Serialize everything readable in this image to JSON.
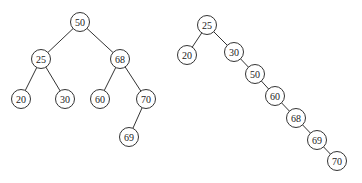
{
  "diagram": {
    "type": "binary-search-trees",
    "node_radius": 9.5,
    "trees": [
      {
        "name": "balanced-bst",
        "nodes": [
          {
            "id": "l50",
            "label": "50",
            "x": 80,
            "y": 22
          },
          {
            "id": "l25",
            "label": "25",
            "x": 41,
            "y": 59
          },
          {
            "id": "l68",
            "label": "68",
            "x": 120,
            "y": 59
          },
          {
            "id": "l20",
            "label": "20",
            "x": 21,
            "y": 99
          },
          {
            "id": "l30",
            "label": "30",
            "x": 65,
            "y": 99
          },
          {
            "id": "l60",
            "label": "60",
            "x": 100,
            "y": 99
          },
          {
            "id": "l70",
            "label": "70",
            "x": 146,
            "y": 99
          },
          {
            "id": "l69",
            "label": "69",
            "x": 129,
            "y": 137
          }
        ],
        "edges": [
          [
            "l50",
            "l25"
          ],
          [
            "l50",
            "l68"
          ],
          [
            "l25",
            "l20"
          ],
          [
            "l25",
            "l30"
          ],
          [
            "l68",
            "l60"
          ],
          [
            "l68",
            "l70"
          ],
          [
            "l70",
            "l69"
          ]
        ]
      },
      {
        "name": "skewed-bst",
        "nodes": [
          {
            "id": "r25",
            "label": "25",
            "x": 207,
            "y": 25
          },
          {
            "id": "r20",
            "label": "20",
            "x": 187,
            "y": 55
          },
          {
            "id": "r30",
            "label": "30",
            "x": 234,
            "y": 52
          },
          {
            "id": "r50",
            "label": "50",
            "x": 255,
            "y": 74
          },
          {
            "id": "r60",
            "label": "60",
            "x": 275,
            "y": 96
          },
          {
            "id": "r68",
            "label": "68",
            "x": 296,
            "y": 118
          },
          {
            "id": "r69",
            "label": "69",
            "x": 317,
            "y": 140
          },
          {
            "id": "r70",
            "label": "70",
            "x": 337,
            "y": 161
          }
        ],
        "edges": [
          [
            "r25",
            "r20"
          ],
          [
            "r25",
            "r30"
          ],
          [
            "r30",
            "r50"
          ],
          [
            "r50",
            "r60"
          ],
          [
            "r60",
            "r68"
          ],
          [
            "r68",
            "r69"
          ],
          [
            "r69",
            "r70"
          ]
        ]
      }
    ]
  }
}
